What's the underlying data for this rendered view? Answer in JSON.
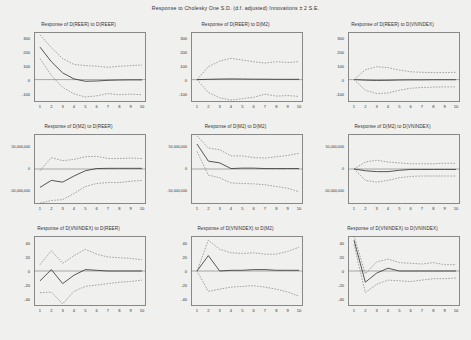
{
  "title": "Response to Cholesky One S.D. (d.f. adjusted) Innovations ± 2 S.E.",
  "axis": {
    "x_ticks": [
      1,
      2,
      3,
      4,
      5,
      6,
      7,
      8,
      9,
      10
    ],
    "scale_small": {
      "ticks": [
        300,
        200,
        100,
        0,
        -100
      ],
      "labels": [
        "300",
        "200",
        "100",
        "0",
        "-100"
      ],
      "min": -160,
      "max": 340
    },
    "scale_large": {
      "ticks": [
        50000000,
        0,
        -50000000
      ],
      "labels": [
        "50,000,000",
        "0",
        "-50,000,000"
      ],
      "min": -80000000,
      "max": 80000000
    },
    "scale_index": {
      "ticks": [
        40,
        20,
        0,
        -20,
        -40
      ],
      "labels": [
        "40",
        "20",
        "0",
        "-20",
        "-40"
      ],
      "min": -50,
      "max": 50
    }
  },
  "chart_data": {
    "type": "line",
    "title": "Response to Cholesky One S.D. (d.f. adjusted) Innovations ± 2 S.E.",
    "xlabel": "",
    "ylabel": "",
    "grid": false,
    "legend": "none",
    "x": [
      1,
      2,
      3,
      4,
      5,
      6,
      7,
      8,
      9,
      10
    ],
    "panels": [
      {
        "title": "Response of D(REER) to D(REER)",
        "row": 1,
        "col": 1,
        "scale": "scale_small",
        "ylim": [
          -160,
          340
        ],
        "series": [
          {
            "name": "irf",
            "style": "solid",
            "values": [
              232,
              128,
              48,
              5,
              -12,
              -10,
              -5,
              -3,
              -2,
              -2
            ]
          },
          {
            "name": "upper",
            "style": "dashed",
            "values": [
              320,
              228,
              150,
              108,
              100,
              96,
              88,
              95,
              100,
              104
            ]
          },
          {
            "name": "lower",
            "style": "dashed",
            "values": [
              150,
              30,
              -55,
              -102,
              -124,
              -116,
              -100,
              -108,
              -104,
              -108
            ]
          }
        ]
      },
      {
        "title": "Response of D(REER) to D(M2)",
        "row": 1,
        "col": 2,
        "scale": "scale_small",
        "ylim": [
          -160,
          340
        ],
        "series": [
          {
            "name": "irf",
            "style": "solid",
            "values": [
              0,
              2,
              4,
              5,
              4,
              3,
              3,
              2,
              2,
              2
            ]
          },
          {
            "name": "upper",
            "style": "dashed",
            "values": [
              0,
              92,
              132,
              152,
              140,
              128,
              118,
              128,
              122,
              128
            ]
          },
          {
            "name": "lower",
            "style": "dashed",
            "values": [
              0,
              -92,
              -130,
              -146,
              -136,
              -126,
              -104,
              -118,
              -114,
              -120
            ]
          }
        ]
      },
      {
        "title": "Response of D(REER) to D(VNINDEX)",
        "row": 1,
        "col": 3,
        "scale": "scale_small",
        "ylim": [
          -160,
          340
        ],
        "series": [
          {
            "name": "irf",
            "style": "solid",
            "values": [
              0,
              -4,
              -6,
              -5,
              -3,
              -2,
              -2,
              -1,
              -1,
              -1
            ]
          },
          {
            "name": "upper",
            "style": "dashed",
            "values": [
              0,
              70,
              92,
              86,
              68,
              56,
              52,
              50,
              50,
              52
            ]
          },
          {
            "name": "lower",
            "style": "dashed",
            "values": [
              0,
              -76,
              -100,
              -96,
              -76,
              -62,
              -56,
              -54,
              -52,
              -52
            ]
          }
        ]
      },
      {
        "title": "Response of D(M2) to D(REER)",
        "row": 2,
        "col": 1,
        "scale": "scale_large",
        "ylim": [
          -80000000,
          80000000
        ],
        "series": [
          {
            "name": "irf",
            "style": "solid",
            "values": [
              -42000000,
              -26000000,
              -30000000,
              -16000000,
              -4000000,
              1000000,
              1500000,
              1500000,
              1500000,
              1500000
            ]
          },
          {
            "name": "upper",
            "style": "dashed",
            "values": [
              -4000000,
              26000000,
              19000000,
              22000000,
              28000000,
              29000000,
              24000000,
              24000000,
              25000000,
              24000000
            ]
          },
          {
            "name": "lower",
            "style": "dashed",
            "values": [
              -78000000,
              -72000000,
              -70000000,
              -56000000,
              -40000000,
              -33000000,
              -31000000,
              -31000000,
              -28000000,
              -26000000
            ]
          }
        ]
      },
      {
        "title": "Response of D(M2) to D(M2)",
        "row": 2,
        "col": 2,
        "scale": "scale_large",
        "ylim": [
          -80000000,
          80000000
        ],
        "series": [
          {
            "name": "irf",
            "style": "solid",
            "values": [
              57000000,
              18000000,
              14000000,
              1000000,
              2000000,
              2000000,
              1000000,
              1000000,
              1000000,
              1000000
            ]
          },
          {
            "name": "upper",
            "style": "dashed",
            "values": [
              76000000,
              48000000,
              44000000,
              30000000,
              30000000,
              26000000,
              25000000,
              28000000,
              31000000,
              36000000
            ]
          },
          {
            "name": "lower",
            "style": "dashed",
            "values": [
              40000000,
              -14000000,
              -20000000,
              -32000000,
              -33000000,
              -34000000,
              -36000000,
              -40000000,
              -44000000,
              -52000000
            ]
          }
        ]
      },
      {
        "title": "Response of D(M2) to D(VNINDEX)",
        "row": 2,
        "col": 3,
        "scale": "scale_large",
        "ylim": [
          -80000000,
          80000000
        ],
        "series": [
          {
            "name": "irf",
            "style": "solid",
            "values": [
              0,
              -4000000,
              -6000000,
              -6000000,
              -3000000,
              -1000000,
              -1000000,
              -1000000,
              -1000000,
              -1000000
            ]
          },
          {
            "name": "upper",
            "style": "dashed",
            "values": [
              0,
              16000000,
              20000000,
              16000000,
              14000000,
              12000000,
              12000000,
              12000000,
              13000000,
              13000000
            ]
          },
          {
            "name": "lower",
            "style": "dashed",
            "values": [
              0,
              -26000000,
              -30000000,
              -26000000,
              -20000000,
              -17000000,
              -16000000,
              -16000000,
              -16000000,
              -16000000
            ]
          }
        ]
      },
      {
        "title": "Response of D(VNINDEX) to D(REER)",
        "row": 3,
        "col": 1,
        "scale": "scale_index",
        "ylim": [
          -50,
          50
        ],
        "series": [
          {
            "name": "irf",
            "style": "solid",
            "values": [
              -14,
              2,
              -18,
              -6,
              2,
              1,
              0,
              0,
              0,
              0
            ]
          },
          {
            "name": "upper",
            "style": "dashed",
            "values": [
              9,
              29,
              11,
              22,
              31,
              24,
              20,
              19,
              18,
              16
            ]
          },
          {
            "name": "lower",
            "style": "dashed",
            "values": [
              -31,
              -30,
              -47,
              -29,
              -22,
              -20,
              -18,
              -16,
              -15,
              -13
            ]
          }
        ]
      },
      {
        "title": "Response of D(VNINDEX) to D(M2)",
        "row": 3,
        "col": 2,
        "scale": "scale_index",
        "ylim": [
          -50,
          50
        ],
        "series": [
          {
            "name": "irf",
            "style": "solid",
            "values": [
              0,
              22,
              0,
              1,
              1,
              2,
              2,
              1,
              1,
              1
            ]
          },
          {
            "name": "upper",
            "style": "dashed",
            "values": [
              0,
              44,
              31,
              26,
              25,
              26,
              24,
              24,
              28,
              34
            ]
          },
          {
            "name": "lower",
            "style": "dashed",
            "values": [
              0,
              -29,
              -26,
              -23,
              -22,
              -21,
              -23,
              -26,
              -30,
              -36
            ]
          }
        ]
      },
      {
        "title": "Response of D(VNINDEX) to D(VNINDEX)",
        "row": 3,
        "col": 3,
        "scale": "scale_index",
        "ylim": [
          -50,
          50
        ],
        "series": [
          {
            "name": "irf",
            "style": "solid",
            "values": [
              44,
              -16,
              -3,
              4,
              0,
              0,
              0,
              0,
              0,
              0
            ]
          },
          {
            "name": "upper",
            "style": "dashed",
            "values": [
              50,
              -4,
              13,
              17,
              12,
              11,
              10,
              12,
              9,
              9
            ]
          },
          {
            "name": "lower",
            "style": "dashed",
            "values": [
              38,
              -31,
              -19,
              -13,
              -14,
              -15,
              -13,
              -11,
              -11,
              -10
            ]
          }
        ]
      }
    ]
  }
}
